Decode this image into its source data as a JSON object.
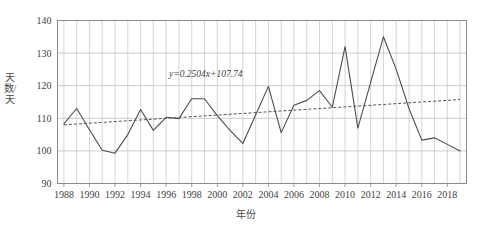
{
  "chart_data": {
    "type": "line",
    "title": "",
    "xlabel": "年份",
    "ylabel": "天数/天",
    "xlim": [
      1987.5,
      2019.5
    ],
    "ylim": [
      90,
      140
    ],
    "grid": true,
    "legend": "none",
    "y_ticks": [
      90,
      100,
      110,
      120,
      130,
      140
    ],
    "x_ticks": [
      1988,
      1990,
      1992,
      1994,
      1996,
      1998,
      2000,
      2002,
      2004,
      2006,
      2008,
      2010,
      2012,
      2014,
      2016,
      2018
    ],
    "x": [
      1988,
      1989,
      1990,
      1991,
      1992,
      1993,
      1994,
      1995,
      1996,
      1997,
      1998,
      1999,
      2000,
      2001,
      2002,
      2003,
      2004,
      2005,
      2006,
      2007,
      2008,
      2009,
      2010,
      2011,
      2012,
      2013,
      2014,
      2015,
      2016,
      2017,
      2018,
      2019
    ],
    "series": [
      {
        "name": "天数",
        "style": "solid",
        "color": "#4d4d4d",
        "values": [
          108.3,
          113.0,
          106.5,
          100.2,
          99.3,
          105.0,
          112.7,
          106.3,
          110.3,
          109.9,
          116.0,
          116.0,
          110.8,
          106.3,
          102.3,
          111.0,
          119.8,
          105.6,
          114.0,
          115.5,
          118.5,
          113.4,
          132.0,
          107.0,
          121.0,
          135.0,
          125.0,
          113.0,
          103.3,
          104.0,
          102.0,
          100.0
        ]
      }
    ],
    "trendline": {
      "name": "线性趋势线",
      "style": "dashed",
      "color": "#555555",
      "equation": "y=0.2504x+107.74",
      "slope": 0.2504,
      "intercept": 107.74,
      "start": {
        "x": 1988,
        "y": 107.99
      },
      "end": {
        "x": 2019,
        "y": 115.75
      }
    },
    "annotations": [
      {
        "name": "trendline-equation",
        "text": "y=0.2504x+107.74",
        "x": 1999.1,
        "y": 122.8
      }
    ]
  },
  "axes": {
    "y_title": "天数/天",
    "x_title": "年份",
    "y_tick_labels": [
      "140",
      "130",
      "120",
      "110",
      "100",
      "90"
    ],
    "x_tick_labels": [
      "1988",
      "1990",
      "1992",
      "1994",
      "1996",
      "1998",
      "2000",
      "2002",
      "2004",
      "2006",
      "2008",
      "2010",
      "2012",
      "2014",
      "2016",
      "2018"
    ]
  },
  "colors": {
    "series_line": "#4d4d4d",
    "trendline": "#555555",
    "grid": "#b8b8b8",
    "axis": "#8c8c8c",
    "text": "#3f3f3f",
    "background": "#ffffff"
  }
}
